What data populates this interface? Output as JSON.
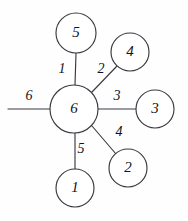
{
  "figure": {
    "type": "star-graph-diagram",
    "background_color": "#fefefe",
    "stroke_color": "#3a3a42",
    "text_color": "#121218"
  },
  "hub": {
    "label": "6",
    "cx": 74,
    "cy": 109,
    "r": 24
  },
  "nodes": [
    {
      "id": "node-top",
      "label": "5",
      "cx": 76,
      "cy": 33,
      "r": 20
    },
    {
      "id": "node-top-right",
      "label": "4",
      "cx": 130,
      "cy": 52,
      "r": 19
    },
    {
      "id": "node-right",
      "label": "3",
      "cx": 155,
      "cy": 109,
      "r": 19
    },
    {
      "id": "node-bottom-right",
      "label": "2",
      "cx": 128,
      "cy": 168,
      "r": 19
    },
    {
      "id": "node-bottom",
      "label": "1",
      "cx": 75,
      "cy": 188,
      "r": 19
    }
  ],
  "edges": [
    {
      "id": "edge-1",
      "label": "1",
      "from": "hub",
      "to": "node-top",
      "x1": 75,
      "y1": 85,
      "x2": 76,
      "y2": 53,
      "label_x": 62,
      "label_y": 70
    },
    {
      "id": "edge-2",
      "label": "2",
      "from": "hub",
      "to": "node-top-right",
      "x1": 92,
      "y1": 92,
      "x2": 117,
      "y2": 66,
      "label_x": 101,
      "label_y": 70
    },
    {
      "id": "edge-3",
      "label": "3",
      "from": "hub",
      "to": "node-right",
      "x1": 98,
      "y1": 109,
      "x2": 136,
      "y2": 109,
      "label_x": 117,
      "label_y": 97
    },
    {
      "id": "edge-4",
      "label": "4",
      "from": "hub",
      "to": "node-bottom-right",
      "x1": 92,
      "y1": 126,
      "x2": 116,
      "y2": 154,
      "label_x": 119,
      "label_y": 133
    },
    {
      "id": "edge-5",
      "label": "5",
      "from": "hub",
      "to": "node-bottom",
      "x1": 75,
      "y1": 133,
      "x2": 75,
      "y2": 169,
      "label_x": 81,
      "label_y": 150
    },
    {
      "id": "edge-6",
      "label": "6",
      "from": "hub",
      "to": "free-end",
      "x1": 50,
      "y1": 109,
      "x2": 8,
      "y2": 109,
      "label_x": 29,
      "label_y": 97
    }
  ]
}
